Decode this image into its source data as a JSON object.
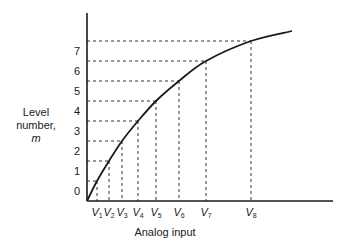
{
  "chart_data": {
    "type": "line",
    "title": "",
    "xlabel": "Analog input",
    "ylabel": "Level number, m",
    "ylabel_lines": [
      "Level",
      "number,",
      "m"
    ],
    "y_tick_labels": [
      "0",
      "1",
      "2",
      "3",
      "4",
      "5",
      "6",
      "7"
    ],
    "x_tick_labels": [
      "V1",
      "V2",
      "V3",
      "V4",
      "V5",
      "V6",
      "V7",
      "V8"
    ],
    "x_tick_label_parts": [
      {
        "v": "V",
        "sub": "1"
      },
      {
        "v": "V",
        "sub": "2"
      },
      {
        "v": "V",
        "sub": "3"
      },
      {
        "v": "V",
        "sub": "4"
      },
      {
        "v": "V",
        "sub": "5"
      },
      {
        "v": "V",
        "sub": "6"
      },
      {
        "v": "V",
        "sub": "7"
      },
      {
        "v": "V",
        "sub": "8"
      }
    ],
    "grid": false,
    "dashed_projections": true,
    "series": [
      {
        "name": "Quantizer characteristic",
        "points_px": [
          [
            87,
            201
          ],
          [
            97,
            181
          ],
          [
            109,
            161
          ],
          [
            122,
            141
          ],
          [
            138,
            121
          ],
          [
            156,
            101
          ],
          [
            179,
            81
          ],
          [
            206,
            61
          ],
          [
            251,
            41
          ],
          [
            292,
            31
          ]
        ]
      }
    ],
    "thresholds": [
      {
        "label": "V1",
        "level_boundary": 0.5,
        "x_px": 97,
        "y_px": 181
      },
      {
        "label": "V2",
        "level_boundary": 1.5,
        "x_px": 109,
        "y_px": 161
      },
      {
        "label": "V3",
        "level_boundary": 2.5,
        "x_px": 122,
        "y_px": 141
      },
      {
        "label": "V4",
        "level_boundary": 3.5,
        "x_px": 138,
        "y_px": 121
      },
      {
        "label": "V5",
        "level_boundary": 4.5,
        "x_px": 156,
        "y_px": 101
      },
      {
        "label": "V6",
        "level_boundary": 5.5,
        "x_px": 179,
        "y_px": 81
      },
      {
        "label": "V7",
        "level_boundary": 6.5,
        "x_px": 206,
        "y_px": 61
      },
      {
        "label": "V8",
        "level_boundary": 7.5,
        "x_px": 251,
        "y_px": 41
      }
    ],
    "y_label_positions_px": [
      191,
      171,
      151,
      131,
      111,
      91,
      71,
      51
    ],
    "axes": {
      "origin_px": [
        87,
        201
      ],
      "x_end_px": 333,
      "y_top_px": 13
    },
    "colors": {
      "line": "#1a1a1a",
      "dash": "#333333",
      "background": "#ffffff"
    }
  }
}
